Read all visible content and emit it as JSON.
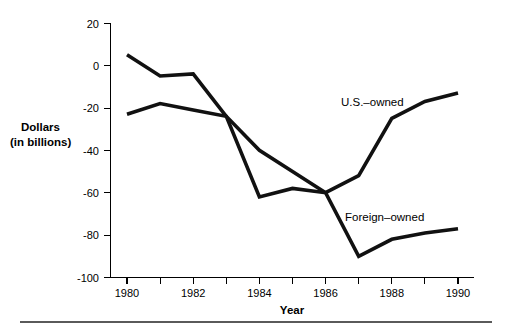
{
  "chart_data": {
    "type": "line",
    "title": "",
    "subtitle": "",
    "xlabel": "Year",
    "ylabel": "Dollars\n(in billions)",
    "ylabel_line1": "Dollars",
    "ylabel_line2": "(in billions)",
    "x": [
      1980,
      1981,
      1982,
      1983,
      1984,
      1985,
      1986,
      1987,
      1988,
      1989,
      1990
    ],
    "categories": [
      "1980",
      "1981",
      "1982",
      "1983",
      "1984",
      "1985",
      "1986",
      "1987",
      "1988",
      "1989",
      "1990"
    ],
    "xlim": [
      1980,
      1990
    ],
    "ylim": [
      -100,
      20
    ],
    "grid": false,
    "legend_position": "inline-annotations",
    "xtick_values": [
      1980,
      1981,
      1982,
      1983,
      1984,
      1985,
      1986,
      1987,
      1988,
      1989,
      1990
    ],
    "xtick_labels": [
      "1980",
      "",
      "1982",
      "",
      "1984",
      "",
      "1986",
      "",
      "1988",
      "",
      "1990"
    ],
    "xtick_labels_shown": [
      "1980",
      "1982",
      "1984",
      "1986",
      "1988",
      "1990"
    ],
    "ytick_values": [
      20,
      0,
      -20,
      -40,
      -60,
      -80,
      -100
    ],
    "ytick_labels": [
      "20",
      "0",
      "-20",
      "-40",
      "-60",
      "-80",
      "-100"
    ],
    "series": [
      {
        "name": "U.S.–owned",
        "color": "#111111",
        "values": [
          5,
          -5,
          -4,
          -24,
          -62,
          -58,
          -60,
          -52,
          -25,
          -17,
          -13
        ]
      },
      {
        "name": "Foreign–owned",
        "color": "#111111",
        "values": [
          -23,
          -18,
          -21,
          -24,
          -40,
          -50,
          -60,
          -90,
          -82,
          -79,
          -77
        ]
      }
    ],
    "annotations": [
      {
        "text": "U.S.–owned",
        "x": 1986.05,
        "y": -16,
        "series": 0
      },
      {
        "text": "Foreign–owned",
        "x": 1986.15,
        "y": -70,
        "series": 1
      }
    ]
  },
  "axis": {
    "y_title_line1": "Dollars",
    "y_title_line2": "(in billions)",
    "x_title": "Year"
  },
  "colors": {
    "line": "#111111",
    "axis": "#000000",
    "text": "#000000",
    "footer_rule": "#5a5a5a",
    "background": "#ffffff"
  }
}
